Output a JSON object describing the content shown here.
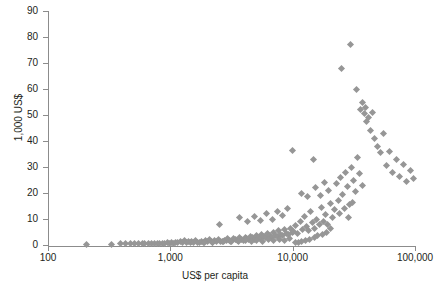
{
  "chart_data": {
    "type": "scatter",
    "title": "",
    "xlabel": "US$ per capita",
    "ylabel": "1,000 US$",
    "xscale": "log",
    "yscale": "linear",
    "xlim": [
      100,
      100000
    ],
    "ylim": [
      0,
      90
    ],
    "grid": false,
    "legend": null,
    "marker": {
      "shape": "diamond",
      "color": "#969696",
      "size": 5
    },
    "xticks": [
      100,
      1000,
      10000,
      100000
    ],
    "xtick_labels": [
      "100",
      "1,000",
      "10,000",
      "100,000"
    ],
    "yticks": [
      0,
      10,
      20,
      30,
      40,
      50,
      60,
      70,
      80,
      90
    ],
    "ytick_labels": [
      "0",
      "10",
      "20",
      "30",
      "40",
      "50",
      "60",
      "70",
      "80",
      "90"
    ],
    "points": [
      [
        205,
        0.3
      ],
      [
        330,
        0.3
      ],
      [
        390,
        0.4
      ],
      [
        430,
        0.4
      ],
      [
        470,
        0.5
      ],
      [
        510,
        0.4
      ],
      [
        545,
        0.5
      ],
      [
        590,
        0.5
      ],
      [
        620,
        0.4
      ],
      [
        660,
        0.6
      ],
      [
        700,
        0.5
      ],
      [
        740,
        0.6
      ],
      [
        780,
        0.5
      ],
      [
        820,
        0.7
      ],
      [
        860,
        0.6
      ],
      [
        900,
        0.5
      ],
      [
        940,
        0.8
      ],
      [
        980,
        0.6
      ],
      [
        1020,
        0.9
      ],
      [
        1060,
        0.7
      ],
      [
        1100,
        1.1
      ],
      [
        1150,
        0.8
      ],
      [
        1200,
        1.3
      ],
      [
        1250,
        0.9
      ],
      [
        1300,
        1.6
      ],
      [
        1350,
        1.0
      ],
      [
        1400,
        1.2
      ],
      [
        1450,
        0.8
      ],
      [
        1500,
        1.5
      ],
      [
        1560,
        1.0
      ],
      [
        1620,
        1.8
      ],
      [
        1680,
        1.1
      ],
      [
        1740,
        0.9
      ],
      [
        1800,
        1.4
      ],
      [
        1870,
        1.0
      ],
      [
        1940,
        1.6
      ],
      [
        2000,
        1.2
      ],
      [
        2080,
        2.0
      ],
      [
        2150,
        1.3
      ],
      [
        2230,
        1.1
      ],
      [
        2310,
        1.7
      ],
      [
        2400,
        1.4
      ],
      [
        2480,
        2.2
      ],
      [
        2570,
        1.5
      ],
      [
        2660,
        1.2
      ],
      [
        2760,
        1.9
      ],
      [
        2860,
        1.6
      ],
      [
        2960,
        2.4
      ],
      [
        3070,
        1.8
      ],
      [
        3180,
        1.4
      ],
      [
        3300,
        2.6
      ],
      [
        3420,
        2.0
      ],
      [
        3540,
        1.7
      ],
      [
        3670,
        2.8
      ],
      [
        3800,
        2.2
      ],
      [
        3940,
        1.9
      ],
      [
        4080,
        3.0
      ],
      [
        4230,
        2.4
      ],
      [
        4380,
        2.1
      ],
      [
        4540,
        3.4
      ],
      [
        4700,
        2.7
      ],
      [
        4870,
        2.3
      ],
      [
        5050,
        3.8
      ],
      [
        5230,
        2.9
      ],
      [
        5420,
        2.5
      ],
      [
        5610,
        4.2
      ],
      [
        5820,
        3.2
      ],
      [
        6020,
        2.8
      ],
      [
        6240,
        4.6
      ],
      [
        6460,
        3.5
      ],
      [
        6700,
        3.0
      ],
      [
        6940,
        5.0
      ],
      [
        7190,
        3.8
      ],
      [
        7450,
        3.3
      ],
      [
        7720,
        5.4
      ],
      [
        8000,
        4.1
      ],
      [
        8290,
        3.6
      ],
      [
        8590,
        5.8
      ],
      [
        8900,
        4.4
      ],
      [
        9220,
        3.9
      ],
      [
        9550,
        6.2
      ],
      [
        9900,
        4.8
      ],
      [
        1900,
        0.9
      ],
      [
        2200,
        1.0
      ],
      [
        2700,
        1.3
      ],
      [
        3100,
        1.5
      ],
      [
        3600,
        1.3
      ],
      [
        4100,
        1.6
      ],
      [
        4600,
        1.4
      ],
      [
        5100,
        1.8
      ],
      [
        5700,
        1.5
      ],
      [
        6300,
        2.0
      ],
      [
        7000,
        1.7
      ],
      [
        7800,
        2.2
      ],
      [
        8600,
        1.9
      ],
      [
        9500,
        2.4
      ],
      [
        2500,
        8.0
      ],
      [
        3700,
        10.5
      ],
      [
        4300,
        9.0
      ],
      [
        4900,
        11.0
      ],
      [
        5500,
        9.5
      ],
      [
        6100,
        12.0
      ],
      [
        6800,
        10.0
      ],
      [
        7500,
        13.0
      ],
      [
        8300,
        11.5
      ],
      [
        9100,
        14.0
      ],
      [
        10200,
        5.2
      ],
      [
        10600,
        7.5
      ],
      [
        11000,
        4.5
      ],
      [
        11500,
        9.0
      ],
      [
        12000,
        6.0
      ],
      [
        12500,
        11.0
      ],
      [
        13000,
        7.0
      ],
      [
        13500,
        5.5
      ],
      [
        14000,
        13.0
      ],
      [
        14600,
        8.5
      ],
      [
        15200,
        6.5
      ],
      [
        15800,
        10.0
      ],
      [
        16500,
        7.8
      ],
      [
        17200,
        14.5
      ],
      [
        17900,
        9.2
      ],
      [
        18600,
        11.8
      ],
      [
        19400,
        8.0
      ],
      [
        20200,
        16.0
      ],
      [
        21000,
        10.5
      ],
      [
        21900,
        13.5
      ],
      [
        10000,
        36.5
      ],
      [
        14800,
        33.0
      ],
      [
        11800,
        20.0
      ],
      [
        13200,
        18.5
      ],
      [
        15500,
        22.0
      ],
      [
        16800,
        19.0
      ],
      [
        18200,
        24.0
      ],
      [
        19800,
        21.0
      ],
      [
        22800,
        23.5
      ],
      [
        23700,
        17.0
      ],
      [
        24700,
        26.0
      ],
      [
        25700,
        19.5
      ],
      [
        26800,
        28.0
      ],
      [
        27900,
        22.5
      ],
      [
        29000,
        15.5
      ],
      [
        30200,
        30.0
      ],
      [
        31500,
        25.0
      ],
      [
        32800,
        20.5
      ],
      [
        34100,
        33.5
      ],
      [
        35500,
        27.5
      ],
      [
        37000,
        23.0
      ],
      [
        25000,
        68.0
      ],
      [
        29500,
        77.0
      ],
      [
        36000,
        52.0
      ],
      [
        37500,
        55.0
      ],
      [
        38500,
        50.5
      ],
      [
        39500,
        53.0
      ],
      [
        40500,
        47.5
      ],
      [
        42000,
        49.0
      ],
      [
        43500,
        44.0
      ],
      [
        45000,
        51.0
      ],
      [
        33000,
        60.0
      ],
      [
        47000,
        41.0
      ],
      [
        49000,
        38.0
      ],
      [
        52000,
        35.5
      ],
      [
        55000,
        43.0
      ],
      [
        58000,
        30.5
      ],
      [
        62000,
        36.0
      ],
      [
        66000,
        28.0
      ],
      [
        70000,
        33.0
      ],
      [
        75000,
        26.5
      ],
      [
        80000,
        31.0
      ],
      [
        86000,
        24.5
      ],
      [
        92000,
        28.5
      ],
      [
        98000,
        25.5
      ],
      [
        24000,
        12.0
      ],
      [
        26500,
        14.0
      ],
      [
        28500,
        10.5
      ],
      [
        31000,
        16.5
      ],
      [
        20500,
        6.5
      ],
      [
        19000,
        5.0
      ],
      [
        17500,
        4.2
      ],
      [
        16000,
        3.5
      ],
      [
        15000,
        2.8
      ],
      [
        13800,
        2.2
      ],
      [
        12800,
        1.8
      ],
      [
        11900,
        1.4
      ],
      [
        11200,
        1.1
      ],
      [
        10500,
        0.9
      ]
    ]
  }
}
